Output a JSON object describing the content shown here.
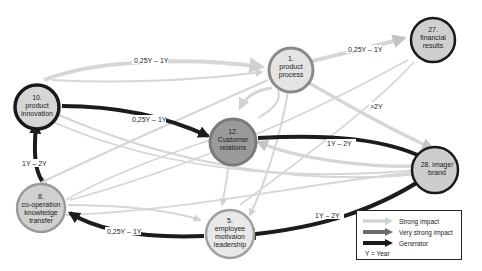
{
  "diagram": {
    "nodes": [
      {
        "id": "n10",
        "number": "10.",
        "lines": [
          "product",
          "innovation"
        ],
        "fill": "#d6d6d6",
        "stroke": "#1a1a1a"
      },
      {
        "id": "n1",
        "number": "1.",
        "lines": [
          "product",
          "process"
        ],
        "fill": "#e4e4e4",
        "stroke": "#8a8a8a"
      },
      {
        "id": "n27",
        "number": "27.",
        "lines": [
          "financial",
          "results"
        ],
        "fill": "#cfcfcf",
        "stroke": "#1a1a1a"
      },
      {
        "id": "n12",
        "number": "12.",
        "lines": [
          "Customer",
          "relations"
        ],
        "fill": "#9a9a9a",
        "stroke": "#7a7a7a"
      },
      {
        "id": "n28",
        "number": "28. image/",
        "lines": [
          "brand"
        ],
        "fill": "#cdcdcd",
        "stroke": "#1a1a1a"
      },
      {
        "id": "n8",
        "number": "8.",
        "lines": [
          "co-operation",
          "knowledge",
          "transfer"
        ],
        "fill": "#d0d0d0",
        "stroke": "#9a9a9a"
      },
      {
        "id": "n5",
        "number": "5.",
        "lines": [
          "employee",
          "motivaion",
          "leadership"
        ],
        "fill": "#e8e8e8",
        "stroke": "#a0a0a0"
      }
    ],
    "edge_labels": {
      "n10_n1": "0,25Y – 1Y",
      "n10_n12": "0,25Y – 1Y",
      "n1_n27": "0,25Y – 1Y",
      "n1_n28": ">2Y",
      "n12_n28": "1Y – 2Y",
      "n8_n10": "1Y – 2Y",
      "n28_n5": "1Y – 2Y",
      "n5_n8": "0,25Y – 1Y"
    }
  },
  "legend": {
    "items": [
      {
        "label": "Strong impact",
        "color": "#d0d0d0"
      },
      {
        "label": "Very strong impact",
        "color": "#6e6e6e"
      },
      {
        "label": "Generator",
        "color": "#1a1a1a"
      }
    ],
    "note": "Y = Year"
  },
  "colors": {
    "strong": "#d4d4d4",
    "very_strong": "#8c8c8c",
    "generator": "#1c1c1c"
  }
}
